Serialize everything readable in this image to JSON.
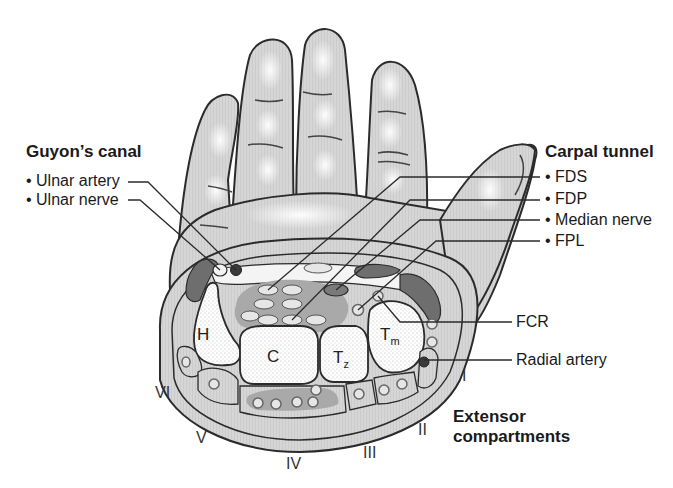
{
  "diagram": {
    "colors": {
      "skin": "#d9d9d9",
      "skin_highlight": "#f2f2f2",
      "outline": "#2b2b2b",
      "section_fill": "#d4d4d4",
      "flexor_sheath": "#a9a9a9",
      "tendon_fill": "#e6e6e6",
      "muscle_dark": "#6e6e6e",
      "artery": "#3a3a3a",
      "bone_fill": "#ffffff",
      "bone_stipple": "#bdbdbd"
    }
  },
  "guyons_canal": {
    "title": "Guyon’s canal",
    "items": [
      {
        "label": "• Ulnar artery"
      },
      {
        "label": "• Ulnar nerve"
      }
    ]
  },
  "carpal_tunnel": {
    "title": "Carpal tunnel",
    "items": [
      {
        "label": "• FDS"
      },
      {
        "label": "• FDP"
      },
      {
        "label": "• Median nerve"
      },
      {
        "label": "• FPL"
      }
    ]
  },
  "right_labels": {
    "fcr": "FCR",
    "radial_artery": "Radial artery"
  },
  "extensor": {
    "title_line1": "Extensor",
    "title_line2": "compartments",
    "compartments": [
      "I",
      "II",
      "III",
      "IV",
      "V",
      "VI"
    ]
  },
  "bones": {
    "hamate": "H",
    "capitate": "C",
    "trapezoid": "T",
    "trapezoid_sub": "z",
    "trapezium": "T",
    "trapezium_sub": "m"
  }
}
